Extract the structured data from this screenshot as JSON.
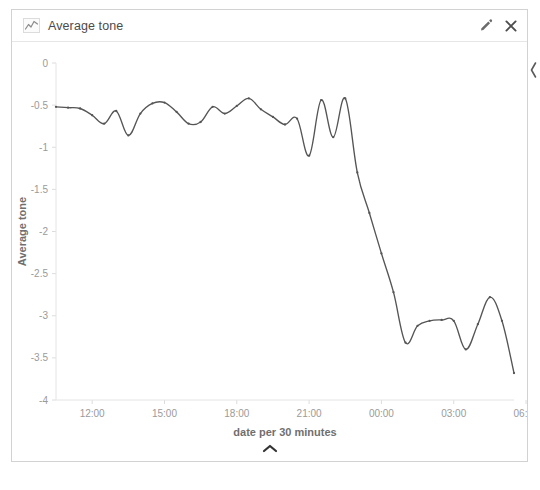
{
  "widget": {
    "title": "Average tone",
    "type_icon": "line-chart-icon",
    "edit_label": "pencil-icon",
    "close_label": "close-icon",
    "collapse_label": "chevron-up-icon",
    "side_handle_label": "chevron-left-icon",
    "accent_color": "#555555",
    "border_color": "#d2d2d2",
    "tick_color": "#9a9a9a"
  },
  "chart_data": {
    "type": "line",
    "title": "Average tone",
    "xlabel": "date per 30 minutes",
    "ylabel": "Average tone",
    "ylim": [
      -4,
      0
    ],
    "yticks": [
      0,
      -0.5,
      -1,
      -1.5,
      -2,
      -2.5,
      -3,
      -3.5,
      -4
    ],
    "ytick_labels": [
      "0",
      "-0.5",
      "-1",
      "-1.5",
      "-2",
      "-2.5",
      "-3",
      "-3.5",
      "-4"
    ],
    "xlim": [
      "10:30",
      "05:30"
    ],
    "xticks": [
      "12:00",
      "15:00",
      "18:00",
      "21:00",
      "00:00",
      "03:00",
      "06:00"
    ],
    "xtick_labels": [
      "12:00",
      "15:00",
      "18:00",
      "21:00",
      "00:00",
      "03:00",
      "06:00"
    ],
    "grid": false,
    "legend": "none",
    "markers": true,
    "series": [
      {
        "name": "Average tone",
        "color": "#555555",
        "x": [
          "10:30",
          "11:00",
          "11:30",
          "12:00",
          "12:30",
          "13:00",
          "13:30",
          "14:00",
          "14:30",
          "15:00",
          "15:30",
          "16:00",
          "16:30",
          "17:00",
          "17:30",
          "18:00",
          "18:30",
          "19:00",
          "19:30",
          "20:00",
          "20:30",
          "21:00",
          "21:30",
          "22:00",
          "22:30",
          "23:00",
          "23:30",
          "00:00",
          "00:30",
          "01:00",
          "01:30",
          "02:00",
          "02:30",
          "03:00",
          "03:30",
          "04:00",
          "04:30",
          "05:00",
          "05:30"
        ],
        "values": [
          -0.52,
          -0.53,
          -0.54,
          -0.62,
          -0.72,
          -0.57,
          -0.86,
          -0.6,
          -0.48,
          -0.47,
          -0.58,
          -0.72,
          -0.7,
          -0.52,
          -0.6,
          -0.51,
          -0.42,
          -0.55,
          -0.64,
          -0.73,
          -0.66,
          -1.1,
          -0.44,
          -0.88,
          -0.42,
          -1.3,
          -1.78,
          -2.26,
          -2.72,
          -3.32,
          -3.12,
          -3.06,
          -3.05,
          -3.06,
          -3.4,
          -3.1,
          -2.78,
          -3.06,
          -3.68
        ]
      }
    ]
  }
}
